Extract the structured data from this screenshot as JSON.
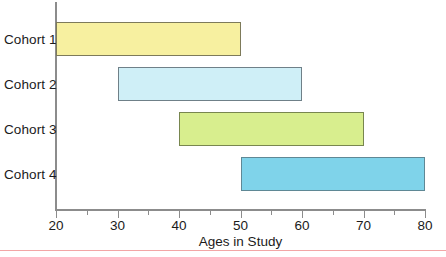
{
  "chart_data": {
    "type": "bar",
    "orientation": "horizontal",
    "subtype": "range-bar",
    "title": "",
    "xlabel": "Ages in Study",
    "ylabel": "",
    "xlim": [
      20,
      80
    ],
    "grid": false,
    "legend": "none",
    "categories": [
      "Cohort 1",
      "Cohort 2",
      "Cohort 3",
      "Cohort 4"
    ],
    "x_major_ticks": [
      20,
      30,
      40,
      50,
      60,
      70,
      80
    ],
    "x_minor_ticks": [
      25,
      35,
      45,
      55,
      65,
      75
    ],
    "x_tick_labels": [
      "20",
      "30",
      "40",
      "50",
      "60",
      "70",
      "80"
    ],
    "bars": [
      {
        "category": "Cohort 1",
        "start": 20,
        "end": 50,
        "span": 30,
        "fill": "#f7f0a0",
        "stroke": "#7d7a5a"
      },
      {
        "category": "Cohort 2",
        "start": 30,
        "end": 60,
        "span": 30,
        "fill": "#cfeff7",
        "stroke": "#6f8088"
      },
      {
        "category": "Cohort 3",
        "start": 40,
        "end": 70,
        "span": 30,
        "fill": "#d8ee8e",
        "stroke": "#78864f"
      },
      {
        "category": "Cohort 4",
        "start": 50,
        "end": 80,
        "span": 30,
        "fill": "#7fd3ea",
        "stroke": "#5f8895"
      }
    ],
    "series": [
      {
        "name": "Age range",
        "values": [
          30,
          30,
          30,
          30
        ]
      }
    ],
    "colors": {
      "axis": "#8c8c8c",
      "text": "#1b1b1b",
      "rule": "#f2a6a6",
      "background": "#ffffff"
    }
  }
}
